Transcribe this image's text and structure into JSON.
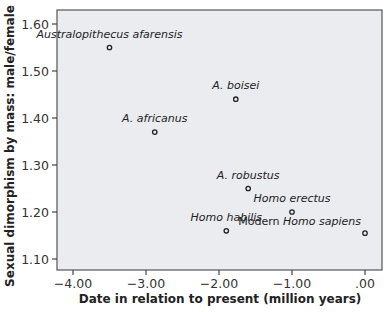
{
  "chart_data": {
    "type": "scatter",
    "title": "",
    "xlabel": "Date in relation to present (million years)",
    "ylabel": "Sexual dimorphism by mass: male/female",
    "xlim": [
      -4.2,
      0.1
    ],
    "ylim": [
      1.075,
      1.625
    ],
    "xticks": [
      -4.0,
      -3.0,
      -2.0,
      -1.0,
      0.0
    ],
    "xtick_labels": [
      "−4.00",
      "−3.00",
      "−2.00",
      "−1.00",
      ".00"
    ],
    "yticks": [
      1.1,
      1.2,
      1.3,
      1.4,
      1.5,
      1.6
    ],
    "ytick_labels": [
      "1.10",
      "1.20",
      "1.30",
      "1.40",
      "1.50",
      "1.60"
    ],
    "grid": false,
    "legend": null,
    "plot_background": "#eaecef",
    "marker": "hollow-circle",
    "points": [
      {
        "label": "Australopithecus afarensis",
        "label_prefix": "",
        "x": -3.5,
        "y": 1.55,
        "label_dx": 0,
        "label_dy": -10,
        "anchor": "middle"
      },
      {
        "label": "A. africanus",
        "label_prefix": "",
        "x": -2.88,
        "y": 1.37,
        "label_dx": 0,
        "label_dy": -10,
        "anchor": "middle"
      },
      {
        "label": "A. boisei",
        "label_prefix": "",
        "x": -1.77,
        "y": 1.44,
        "label_dx": 0,
        "label_dy": -10,
        "anchor": "middle"
      },
      {
        "label": "A. robustus",
        "label_prefix": "",
        "x": -1.6,
        "y": 1.25,
        "label_dx": 0,
        "label_dy": -10,
        "anchor": "middle"
      },
      {
        "label": "Homo erectus",
        "label_prefix": "",
        "x": -1.0,
        "y": 1.2,
        "label_dx": 0,
        "label_dy": -10,
        "anchor": "middle"
      },
      {
        "label": "Homo habilis",
        "label_prefix": "",
        "x": -1.9,
        "y": 1.16,
        "label_dx": 0,
        "label_dy": -10,
        "anchor": "middle"
      },
      {
        "label": "Homo sapiens",
        "label_prefix": "Modern ",
        "x": 0.0,
        "y": 1.155,
        "label_dx": -4,
        "label_dy": -8,
        "anchor": "end"
      }
    ]
  }
}
